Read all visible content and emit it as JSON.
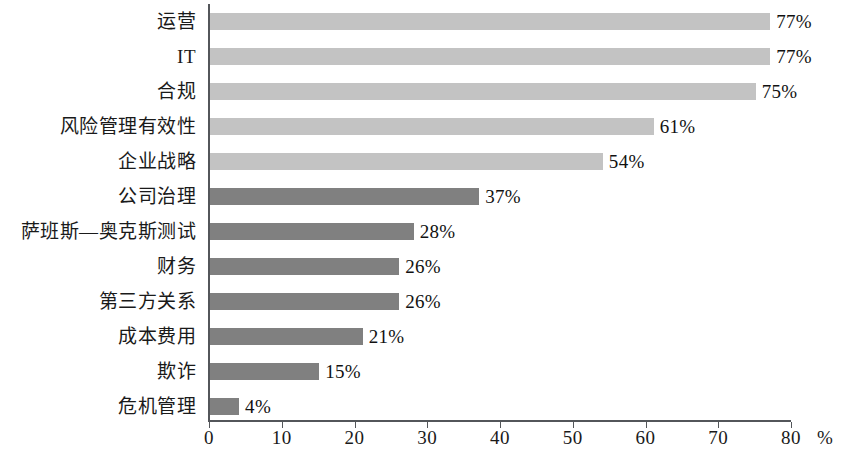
{
  "chart_data": {
    "type": "bar",
    "orientation": "horizontal",
    "title": "",
    "subtitle": "",
    "xlabel": "",
    "ylabel": "",
    "xlim": [
      0,
      80
    ],
    "axis_unit": "%",
    "grid": false,
    "legend": null,
    "xticks": [
      0,
      10,
      20,
      30,
      40,
      50,
      60,
      70,
      80
    ],
    "xtick_labels": [
      "0",
      "10",
      "20",
      "30",
      "40",
      "50",
      "60",
      "70",
      "80"
    ],
    "categories": [
      "运营",
      "IT",
      "合规",
      "风险管理有效性",
      "企业战略",
      "公司治理",
      "萨班斯—奥克斯测试",
      "财务",
      "第三方关系",
      "成本费用",
      "欺诈",
      "危机管理"
    ],
    "values": [
      77,
      77,
      75,
      61,
      54,
      37,
      28,
      26,
      26,
      21,
      15,
      4
    ],
    "data_labels": [
      "77%",
      "77%",
      "75%",
      "61%",
      "54%",
      "37%",
      "28%",
      "26%",
      "26%",
      "21%",
      "15%",
      "4%"
    ],
    "bar_colors": [
      "#c3c3c3",
      "#c3c3c3",
      "#c3c3c3",
      "#c3c3c3",
      "#c3c3c3",
      "#808080",
      "#808080",
      "#808080",
      "#808080",
      "#808080",
      "#808080",
      "#808080"
    ],
    "palette": {
      "light_bar": "#c3c3c3",
      "dark_bar": "#808080",
      "axis": "#53565a",
      "text": "#1a1a1a",
      "background": "#ffffff"
    }
  }
}
